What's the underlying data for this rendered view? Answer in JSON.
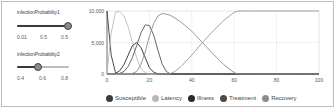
{
  "sliders": [
    {
      "label": "infectionProbability1",
      "ticks": [
        "0.01",
        "0.5",
        "0.5"
      ],
      "value_position": 1.0
    },
    {
      "label": "infectionProbability2",
      "ticks": [
        "0.4",
        "0.6",
        "0.8"
      ],
      "value_position": 0.45
    }
  ],
  "legend": [
    {
      "label": "Susceptible",
      "color": "#3a3a3a"
    },
    {
      "label": "Latency",
      "color": "#b8b8b8"
    },
    {
      "label": "Illness",
      "color": "#2a2a2a"
    },
    {
      "label": "Treatment",
      "color": "#4a4a4a"
    },
    {
      "label": "Recovery",
      "color": "#8c8c8c"
    }
  ],
  "chart_data": {
    "type": "line",
    "title": "",
    "xlabel": "",
    "ylabel": "",
    "xlim": [
      0,
      100
    ],
    "ylim": [
      0,
      10000
    ],
    "x_ticks": [
      "0",
      "20",
      "40",
      "60",
      "80",
      "100"
    ],
    "y_ticks": [
      "0",
      "5,000",
      "10,000"
    ],
    "grid": true,
    "legend_position": "bottom",
    "x": [
      0,
      2,
      4,
      6,
      8,
      10,
      12,
      14,
      16,
      18,
      20,
      22,
      24,
      26,
      28,
      30,
      32,
      35,
      40,
      45,
      50,
      55,
      60,
      62,
      65,
      70,
      80,
      90,
      100
    ],
    "series": [
      {
        "name": "Susceptible",
        "values": [
          10000,
          3000,
          200,
          0,
          0,
          0,
          0,
          0,
          0,
          0,
          0,
          0,
          0,
          0,
          0,
          0,
          0,
          0,
          0,
          0,
          0,
          0,
          0,
          0,
          0,
          0,
          0,
          0,
          0
        ]
      },
      {
        "name": "Latency",
        "values": [
          0,
          6500,
          9800,
          9900,
          9200,
          7500,
          5000,
          2500,
          900,
          200,
          0,
          0,
          0,
          0,
          0,
          0,
          0,
          0,
          0,
          0,
          0,
          0,
          0,
          0,
          0,
          0,
          0,
          0,
          0
        ]
      },
      {
        "name": "Illness",
        "values": [
          0,
          0,
          100,
          500,
          1500,
          3000,
          4500,
          5000,
          4200,
          2600,
          1000,
          300,
          0,
          0,
          0,
          0,
          0,
          0,
          0,
          0,
          0,
          0,
          0,
          0,
          0,
          0,
          0,
          0,
          0
        ]
      },
      {
        "name": "Treatment",
        "values": [
          0,
          0,
          0,
          100,
          400,
          1200,
          2600,
          4500,
          6500,
          7800,
          7700,
          6200,
          3800,
          1600,
          400,
          0,
          0,
          0,
          0,
          0,
          0,
          0,
          0,
          0,
          0,
          0,
          0,
          0,
          0
        ]
      },
      {
        "name": "Recovery",
        "values": [
          0,
          0,
          0,
          0,
          0,
          0,
          100,
          400,
          1500,
          3500,
          6000,
          8000,
          9200,
          9600,
          9500,
          9300,
          8900,
          8200,
          6800,
          5000,
          3200,
          1500,
          200,
          0,
          0,
          0,
          0,
          0,
          0
        ]
      },
      {
        "name": "Recovered-cumulative",
        "values": [
          0,
          0,
          0,
          0,
          0,
          0,
          0,
          0,
          0,
          0,
          0,
          0,
          0,
          0,
          0,
          100,
          400,
          1200,
          3000,
          5000,
          6800,
          8500,
          9800,
          10000,
          10000,
          10000,
          10000,
          10000,
          10000
        ]
      }
    ]
  }
}
